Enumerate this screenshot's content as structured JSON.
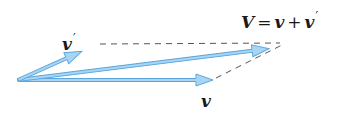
{
  "diagram": {
    "type": "vector-addition",
    "colors": {
      "arrow_fill": "#a9d4f3",
      "arrow_stroke": "#5ba7dd",
      "dashed_line": "#555555",
      "label": "#1a1a1a"
    },
    "origin": [
      18,
      80
    ],
    "vectors": [
      {
        "id": "v_prime",
        "name": "v′",
        "tip": [
          98,
          44
        ]
      },
      {
        "id": "V_sum",
        "name": "V",
        "tip": [
          287,
          42
        ]
      },
      {
        "id": "v",
        "name": "v",
        "tip": [
          213,
          80
        ]
      }
    ],
    "dashed_lines": [
      {
        "from": "v_prime_tip",
        "to": "V_tip"
      },
      {
        "from": "v_tip",
        "to": "V_tip"
      }
    ]
  },
  "labels": {
    "sum": {
      "lhs": "V",
      "eq": "=",
      "term1": "v",
      "plus": "+",
      "term2": "v",
      "term2_prime": "′"
    },
    "v_prime": {
      "symbol": "v",
      "prime": "′"
    },
    "v": {
      "symbol": "v"
    }
  }
}
